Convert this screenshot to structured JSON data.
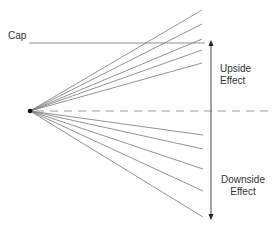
{
  "labels": {
    "cap": "Cap",
    "upside_line1": "Upside",
    "upside_line2": "Effect",
    "downside_line1": "Downside",
    "downside_line2": "Effect"
  },
  "colors": {
    "fan_lines": "#707070",
    "cap_line": "#b0b0b0",
    "dashed_line": "#999999",
    "arrow": "#333333",
    "origin": "#111111"
  }
}
